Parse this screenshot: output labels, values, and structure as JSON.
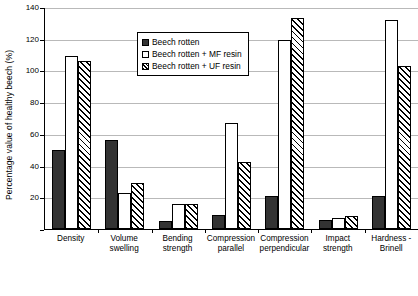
{
  "chart_data": {
    "type": "bar",
    "title": "",
    "xlabel": "",
    "ylabel": "Percentage value of healthy beech (%)",
    "ylim": [
      0,
      140
    ],
    "ytick_step": 20,
    "yticks": [
      0,
      20,
      40,
      60,
      80,
      100,
      120,
      140
    ],
    "grid": true,
    "legend_position": "top-center",
    "categories": [
      "Density",
      "Volume swelling",
      "Bending strength",
      "Compression parallel",
      "Compression perpendicular",
      "Impact strength",
      "Hardness - Brinell"
    ],
    "category_lines": [
      [
        "Density"
      ],
      [
        "Volume",
        "swelling"
      ],
      [
        "Bending",
        "strength"
      ],
      [
        "Compression",
        "parallel"
      ],
      [
        "Compression",
        "perpendicular"
      ],
      [
        "Impact",
        "strength"
      ],
      [
        "Hardness -",
        "Brinell"
      ]
    ],
    "series": [
      {
        "name": "Beech rotten",
        "fill": "solid-dark",
        "color": "#333333",
        "values": [
          50,
          56,
          5,
          9,
          21,
          6,
          21
        ]
      },
      {
        "name": "Beech rotten + MF resin",
        "fill": "dotted-light",
        "color": "#ffffff",
        "values": [
          109,
          23,
          16,
          67,
          119,
          7,
          132
        ]
      },
      {
        "name": "Beech rotten + UF resin",
        "fill": "diagonal-hatch",
        "color": "#ffffff",
        "values": [
          106,
          29,
          16,
          42,
          133,
          8,
          103
        ]
      }
    ]
  }
}
